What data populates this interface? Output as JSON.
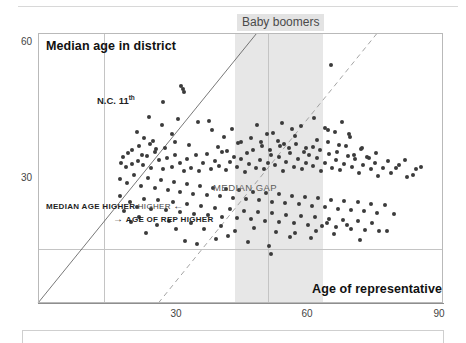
{
  "figure": {
    "axis_titles": {
      "y": "Median age in district",
      "x": "Age of representative"
    },
    "annotations": {
      "band_label": "Baby boomers",
      "median_gap_label": "MEDIAN GAP",
      "median_age_higher": "MEDIAN AGE HIGHER",
      "median_age_higher_arrow": "←",
      "age_of_rep_higher": "AGE OF REP HIGHER",
      "age_of_rep_higher_arrow": "→",
      "outlier_label_main": "N.C. 11",
      "outlier_label_sup": "th"
    },
    "ticks": {
      "y": [
        "60",
        "30"
      ],
      "x": [
        "30",
        "60",
        "90"
      ]
    },
    "colors": {
      "dot": "#3b3b3b",
      "band": "#e7e7e7",
      "band_label_bg": "#e3e3e3",
      "grid": "#c4c4c4",
      "frame": "#b9b9b9",
      "identity_line": "#555555",
      "median_gap_line": "#9a9a9a"
    }
  },
  "chart_data": {
    "type": "scatter",
    "title": "",
    "subtitle": "",
    "xlabel": "Age of representative",
    "ylabel": "Median age in district",
    "xlim": [
      18,
      92
    ],
    "ylim": [
      22,
      62
    ],
    "xticks": [
      30,
      60,
      90
    ],
    "yticks": [
      30,
      60
    ],
    "grid": true,
    "legend": "none",
    "shaded_bands": [
      {
        "name": "Baby boomers",
        "axis": "x",
        "from": 54,
        "to": 70,
        "color": "#e7e7e7",
        "label": "Baby boomers"
      }
    ],
    "reference_lines": [
      {
        "name": "identity",
        "style": "solid-thin",
        "description": "y = x, 45-degree line separating districts where median age exceeds the representative's age from those where it does not",
        "points": [
          [
            18,
            22
          ],
          [
            58,
            62
          ]
        ]
      },
      {
        "name": "MEDIAN GAP",
        "style": "dashed",
        "label": "MEDIAN GAP",
        "description": "parallel offset line marking the typical gap between representative age and district median age",
        "points": [
          [
            40,
            22
          ],
          [
            80,
            62
          ]
        ]
      }
    ],
    "annotated_points": [
      {
        "label": "N.C. 11th",
        "x": 42.5,
        "y": 47.0,
        "note": "district label drawn to the left of the marker"
      }
    ],
    "series": [
      {
        "name": "U.S. House districts",
        "marker": "circle",
        "color": "#3b3b3b",
        "points": [
          [
            44.5,
            53.7
          ],
          [
            44.6,
            53.2
          ],
          [
            38.2,
            49.6
          ],
          [
            43.5,
            49.2
          ],
          [
            49.2,
            49.0
          ],
          [
            36.0,
            47.4
          ],
          [
            42.5,
            47.0
          ],
          [
            37.3,
            46.5
          ],
          [
            39.0,
            46.0
          ],
          [
            36.5,
            45.3
          ],
          [
            35.2,
            44.6
          ],
          [
            34.4,
            44.2
          ],
          [
            33.6,
            43.6
          ],
          [
            33.2,
            42.8
          ],
          [
            34.0,
            42.2
          ],
          [
            35.1,
            42.6
          ],
          [
            36.2,
            43.1
          ],
          [
            37.1,
            42.4
          ],
          [
            38.0,
            43.8
          ],
          [
            38.6,
            42.0
          ],
          [
            39.4,
            44.4
          ],
          [
            40.1,
            43.2
          ],
          [
            40.8,
            41.9
          ],
          [
            41.6,
            43.5
          ],
          [
            42.4,
            42.1
          ],
          [
            43.1,
            44.0
          ],
          [
            43.9,
            42.7
          ],
          [
            44.7,
            41.6
          ],
          [
            45.3,
            43.3
          ],
          [
            46.0,
            42.0
          ],
          [
            46.8,
            43.9
          ],
          [
            47.5,
            41.5
          ],
          [
            48.2,
            42.8
          ],
          [
            48.9,
            44.1
          ],
          [
            49.6,
            41.8
          ],
          [
            50.3,
            43.0
          ],
          [
            51.0,
            42.3
          ],
          [
            51.7,
            44.3
          ],
          [
            52.4,
            41.7
          ],
          [
            53.1,
            42.9
          ],
          [
            53.8,
            43.7
          ],
          [
            54.4,
            42.2
          ],
          [
            55.1,
            43.4
          ],
          [
            55.8,
            41.4
          ],
          [
            56.5,
            42.6
          ],
          [
            57.2,
            44.6
          ],
          [
            57.9,
            42.0
          ],
          [
            58.6,
            43.2
          ],
          [
            59.3,
            41.9
          ],
          [
            60.0,
            42.8
          ],
          [
            60.6,
            44.0
          ],
          [
            61.3,
            42.4
          ],
          [
            62.0,
            43.6
          ],
          [
            62.7,
            41.6
          ],
          [
            63.4,
            42.9
          ],
          [
            64.1,
            44.2
          ],
          [
            64.8,
            42.1
          ],
          [
            65.5,
            43.3
          ],
          [
            66.2,
            41.8
          ],
          [
            66.9,
            42.7
          ],
          [
            67.6,
            43.9
          ],
          [
            68.3,
            42.3
          ],
          [
            69.0,
            43.5
          ],
          [
            69.7,
            41.5
          ],
          [
            70.4,
            42.8
          ],
          [
            71.1,
            44.1
          ],
          [
            71.8,
            42.0
          ],
          [
            72.5,
            43.2
          ],
          [
            73.2,
            41.7
          ],
          [
            73.9,
            42.6
          ],
          [
            74.6,
            43.8
          ],
          [
            75.3,
            42.2
          ],
          [
            76.0,
            43.4
          ],
          [
            76.7,
            41.3
          ],
          [
            77.4,
            42.5
          ],
          [
            78.1,
            43.7
          ],
          [
            78.8,
            41.9
          ],
          [
            79.5,
            42.8
          ],
          [
            80.2,
            40.8
          ],
          [
            81.0,
            42.0
          ],
          [
            82.5,
            41.2
          ],
          [
            84.0,
            42.4
          ],
          [
            85.5,
            40.6
          ],
          [
            87.0,
            41.8
          ],
          [
            33.0,
            40.4
          ],
          [
            34.2,
            39.8
          ],
          [
            35.5,
            40.9
          ],
          [
            36.8,
            39.4
          ],
          [
            38.1,
            40.5
          ],
          [
            39.3,
            39.0
          ],
          [
            40.5,
            40.2
          ],
          [
            41.7,
            38.8
          ],
          [
            42.9,
            39.9
          ],
          [
            44.0,
            38.4
          ],
          [
            45.2,
            39.6
          ],
          [
            46.4,
            38.2
          ],
          [
            47.6,
            39.3
          ],
          [
            48.8,
            38.0
          ],
          [
            50.0,
            39.1
          ],
          [
            51.2,
            37.8
          ],
          [
            52.4,
            38.9
          ],
          [
            53.6,
            37.6
          ],
          [
            54.8,
            38.7
          ],
          [
            56.0,
            37.4
          ],
          [
            57.2,
            38.5
          ],
          [
            58.4,
            37.2
          ],
          [
            59.6,
            38.3
          ],
          [
            60.8,
            37.0
          ],
          [
            62.0,
            38.1
          ],
          [
            63.2,
            36.8
          ],
          [
            64.4,
            37.9
          ],
          [
            65.6,
            36.6
          ],
          [
            66.8,
            37.7
          ],
          [
            68.0,
            36.4
          ],
          [
            69.2,
            37.5
          ],
          [
            70.4,
            36.2
          ],
          [
            71.6,
            37.3
          ],
          [
            72.8,
            36.0
          ],
          [
            74.0,
            37.1
          ],
          [
            75.2,
            35.8
          ],
          [
            76.4,
            36.9
          ],
          [
            77.6,
            35.6
          ],
          [
            78.8,
            36.7
          ],
          [
            80.0,
            35.4
          ],
          [
            81.4,
            36.5
          ],
          [
            83.0,
            35.2
          ],
          [
            34.8,
            37.0
          ],
          [
            36.1,
            36.2
          ],
          [
            37.4,
            37.4
          ],
          [
            38.7,
            36.0
          ],
          [
            40.0,
            37.2
          ],
          [
            41.3,
            35.8
          ],
          [
            42.6,
            36.9
          ],
          [
            43.9,
            35.5
          ],
          [
            45.2,
            36.6
          ],
          [
            46.5,
            35.2
          ],
          [
            47.8,
            36.4
          ],
          [
            49.1,
            35.0
          ],
          [
            50.4,
            36.1
          ],
          [
            51.7,
            34.8
          ],
          [
            53.0,
            35.9
          ],
          [
            54.3,
            34.6
          ],
          [
            55.6,
            35.7
          ],
          [
            56.9,
            34.4
          ],
          [
            58.2,
            35.5
          ],
          [
            59.5,
            34.2
          ],
          [
            60.8,
            35.3
          ],
          [
            62.1,
            34.0
          ],
          [
            63.4,
            35.1
          ],
          [
            64.7,
            33.8
          ],
          [
            66.0,
            34.9
          ],
          [
            67.3,
            33.6
          ],
          [
            68.6,
            34.7
          ],
          [
            69.9,
            33.4
          ],
          [
            71.2,
            34.5
          ],
          [
            72.5,
            33.2
          ],
          [
            73.8,
            34.3
          ],
          [
            75.1,
            33.0
          ],
          [
            76.4,
            34.1
          ],
          [
            77.7,
            32.8
          ],
          [
            79.0,
            33.9
          ],
          [
            80.3,
            32.6
          ],
          [
            44.8,
            31.2
          ],
          [
            47.0,
            30.8
          ],
          [
            50.5,
            31.5
          ],
          [
            52.8,
            32.0
          ],
          [
            56.4,
            31.0
          ],
          [
            60.2,
            30.4
          ],
          [
            60.5,
            29.2
          ],
          [
            64.0,
            31.8
          ],
          [
            67.8,
            31.6
          ],
          [
            72.0,
            32.2
          ],
          [
            76.8,
            31.4
          ],
          [
            81.8,
            32.6
          ],
          [
            37.8,
            32.4
          ],
          [
            35.0,
            34.0
          ],
          [
            33.8,
            35.6
          ],
          [
            32.9,
            37.8
          ],
          [
            36.4,
            34.8
          ],
          [
            39.8,
            33.6
          ],
          [
            41.9,
            34.2
          ],
          [
            43.2,
            33.0
          ],
          [
            45.9,
            33.8
          ],
          [
            48.4,
            32.9
          ],
          [
            51.5,
            33.4
          ],
          [
            54.0,
            32.7
          ],
          [
            57.5,
            33.1
          ],
          [
            61.5,
            32.5
          ],
          [
            65.0,
            32.3
          ],
          [
            68.8,
            32.7
          ],
          [
            70.8,
            33.9
          ],
          [
            74.4,
            33.5
          ],
          [
            55.0,
            45.8
          ],
          [
            57.0,
            46.4
          ],
          [
            59.0,
            45.2
          ],
          [
            61.0,
            47.2
          ],
          [
            63.0,
            45.6
          ],
          [
            65.0,
            46.8
          ],
          [
            67.0,
            45.0
          ],
          [
            69.0,
            46.2
          ],
          [
            71.0,
            47.6
          ],
          [
            73.0,
            45.4
          ],
          [
            75.0,
            46.6
          ],
          [
            77.0,
            44.8
          ],
          [
            62.5,
            48.6
          ],
          [
            64.5,
            47.8
          ],
          [
            66.0,
            48.2
          ],
          [
            68.5,
            49.4
          ],
          [
            70.5,
            48.0
          ],
          [
            72.2,
            47.4
          ],
          [
            73.5,
            48.8
          ],
          [
            74.8,
            47.0
          ],
          [
            71.5,
            57.2
          ],
          [
            44.2,
            54.2
          ],
          [
            40.6,
            48.4
          ],
          [
            47.2,
            48.8
          ],
          [
            49.8,
            47.6
          ],
          [
            52.0,
            46.6
          ],
          [
            53.4,
            47.8
          ],
          [
            58.0,
            48.4
          ],
          [
            59.8,
            47.0
          ],
          [
            61.8,
            46.0
          ],
          [
            45.6,
            45.4
          ],
          [
            43.0,
            45.9
          ],
          [
            41.2,
            45.0
          ],
          [
            39.6,
            44.8
          ],
          [
            38.4,
            45.6
          ],
          [
            37.0,
            44.0
          ],
          [
            50.8,
            45.1
          ],
          [
            52.6,
            44.5
          ],
          [
            54.6,
            45.7
          ],
          [
            56.2,
            44.2
          ],
          [
            58.8,
            45.9
          ],
          [
            60.4,
            44.6
          ],
          [
            62.2,
            45.3
          ],
          [
            63.8,
            44.9
          ],
          [
            65.2,
            45.5
          ],
          [
            66.6,
            44.3
          ],
          [
            68.2,
            45.1
          ],
          [
            69.6,
            44.7
          ],
          [
            70.9,
            45.9
          ],
          [
            72.6,
            44.4
          ],
          [
            74.2,
            45.2
          ],
          [
            75.8,
            44.0
          ],
          [
            77.2,
            45.0
          ],
          [
            78.4,
            43.5
          ],
          [
            79.8,
            44.2
          ],
          [
            82.0,
            43.0
          ],
          [
            83.5,
            42.0
          ],
          [
            85.0,
            43.2
          ],
          [
            86.5,
            41.0
          ],
          [
            88.0,
            42.2
          ]
        ]
      }
    ]
  }
}
